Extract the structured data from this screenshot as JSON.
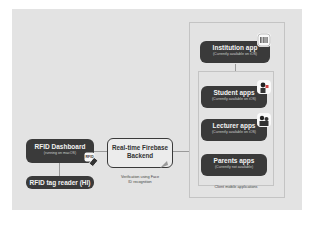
{
  "diagram": {
    "nodes": {
      "institution": {
        "title": "Institution app",
        "subtitle": "(Currently available on iOS)"
      },
      "student": {
        "title": "Student apps",
        "subtitle": "(Currently available on iOS)"
      },
      "lecturer": {
        "title": "Lecturer apps",
        "subtitle": "(Currently available on iOS)"
      },
      "parents": {
        "title": "Parents apps",
        "subtitle": "(Currently not available)"
      },
      "dashboard": {
        "title": "RFID Dashboard",
        "subtitle": "(running on macOS)"
      },
      "reader": {
        "title": "RFID tag reader (HI)"
      },
      "backend": {
        "title": "Real-time Firebase Backend"
      }
    },
    "labels": {
      "client_group": "Client mobile applications",
      "verification": "Verification using Face ID recognition",
      "rfid_badge": "RFID"
    },
    "icons": [
      "barcode-icon",
      "student-avatar-icon",
      "lecturer-avatar-icon",
      "rfid-card-icon",
      "face-id-icon"
    ],
    "colors": {
      "panel": "#e3e3e3",
      "node": "#3a3a3a",
      "node_text": "#f2f2f2",
      "line": "#9a9a9a"
    }
  }
}
